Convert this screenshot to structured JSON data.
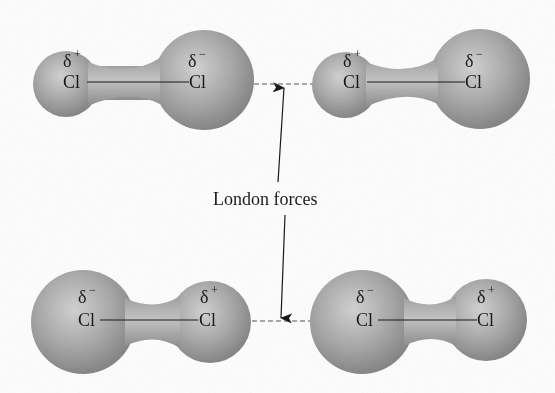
{
  "figure": {
    "label": "London forces",
    "colors": {
      "background": "#fdfdfd",
      "lobe_highlight": "#d2d2d2",
      "lobe_mid": "#ababab",
      "lobe_edge": "#878787",
      "ink": "#1a1a1a"
    },
    "molecules": [
      {
        "position": "top-left",
        "left_atom": {
          "symbol": "Cl",
          "charge": "δ",
          "sign": "+"
        },
        "right_atom": {
          "symbol": "Cl",
          "charge": "δ",
          "sign": "−"
        }
      },
      {
        "position": "top-right",
        "left_atom": {
          "symbol": "Cl",
          "charge": "δ",
          "sign": "+"
        },
        "right_atom": {
          "symbol": "Cl",
          "charge": "δ",
          "sign": "−"
        }
      },
      {
        "position": "bottom-left",
        "left_atom": {
          "symbol": "Cl",
          "charge": "δ",
          "sign": "−"
        },
        "right_atom": {
          "symbol": "Cl",
          "charge": "δ",
          "sign": "+"
        }
      },
      {
        "position": "bottom-right",
        "left_atom": {
          "symbol": "Cl",
          "charge": "δ",
          "sign": "−"
        },
        "right_atom": {
          "symbol": "Cl",
          "charge": "δ",
          "sign": "+"
        }
      }
    ]
  }
}
